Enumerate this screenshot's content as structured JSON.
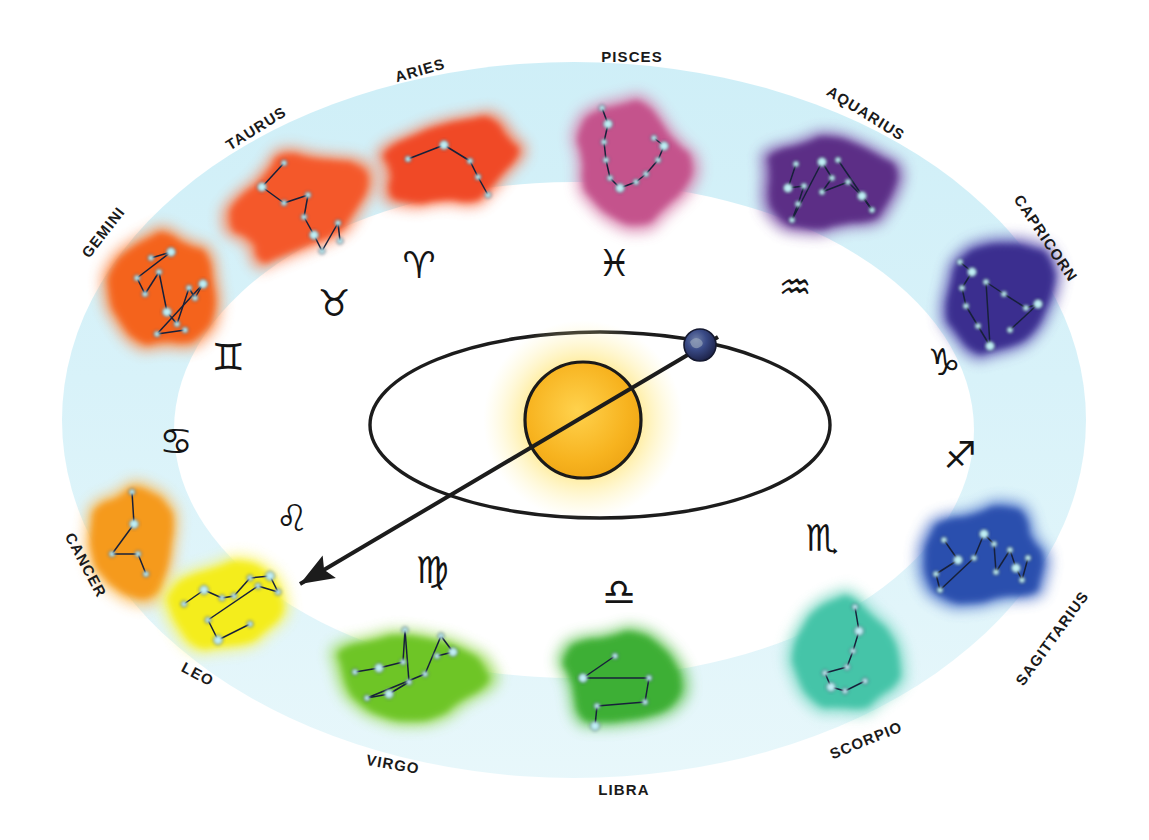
{
  "diagram": {
    "center_objects": {
      "sun": {
        "name": "Sun",
        "color": "#F5B921",
        "glow_color": "#FFE97A",
        "cx": 583,
        "cy": 420,
        "r": 58
      },
      "earth": {
        "name": "Earth",
        "color": "#2A3264",
        "cx": 700,
        "cy": 345,
        "r": 16
      },
      "orbit": {
        "name": "Earth orbit ellipse",
        "cx": 600,
        "cy": 425,
        "rx": 230,
        "ry": 93,
        "stroke": "#1c1c1c"
      },
      "sightline": {
        "name": "Line of sight from Earth through Sun to Leo",
        "x1": 718,
        "y1": 337,
        "x2": 300,
        "y2": 584,
        "stroke": "#1c1c1c"
      }
    },
    "ring": {
      "name": "zodiac band",
      "fill_top": "#CFEFF7",
      "fill_bottom": "#E6F6FA",
      "outer": {
        "cx": 574,
        "cy": 420,
        "rx": 512,
        "ry": 358
      },
      "inner": {
        "cx": 574,
        "cy": 430,
        "rx": 400,
        "ry": 248
      }
    },
    "star_color": "#BFEFF5",
    "signs": [
      {
        "name": "ARIES",
        "symbol": "♈",
        "blob_color": "#F04A26",
        "blob_glow": "#F9714A",
        "label": {
          "x": 420,
          "y": 70,
          "rotate": -16
        },
        "sym": {
          "x": 419,
          "y": 265
        },
        "blob": {
          "cx": 452,
          "cy": 163,
          "rx": 66,
          "ry": 44,
          "rotate": -8
        },
        "stars": [
          [
            -44,
            -4
          ],
          [
            -8,
            -18
          ],
          [
            18,
            -2
          ],
          [
            26,
            14
          ],
          [
            36,
            32
          ]
        ]
      },
      {
        "name": "TAURUS",
        "symbol": "♉",
        "blob_color": "#F4592B",
        "blob_glow": "#FA7C4E",
        "label": {
          "x": 256,
          "y": 128,
          "rotate": -32
        },
        "sym": {
          "x": 334,
          "y": 303
        },
        "blob": {
          "cx": 300,
          "cy": 205,
          "rx": 70,
          "ry": 48,
          "rotate": -36
        },
        "stars": [
          [
            -16,
            -42
          ],
          [
            -38,
            -18
          ],
          [
            -16,
            -2
          ],
          [
            8,
            -10
          ],
          [
            4,
            12
          ],
          [
            14,
            30
          ],
          [
            22,
            46
          ],
          [
            38,
            18
          ],
          [
            40,
            36
          ]
        ]
      },
      {
        "name": "GEMINI",
        "symbol": "♊",
        "blob_color": "#F4641F",
        "blob_glow": "#FA8442",
        "label": {
          "x": 103,
          "y": 232,
          "rotate": -52
        },
        "sym": {
          "x": 228,
          "y": 357
        },
        "blob": {
          "cx": 165,
          "cy": 290,
          "rx": 50,
          "ry": 60,
          "rotate": -10
        },
        "stars": [
          [
            -14,
            -32
          ],
          [
            6,
            -38
          ],
          [
            -28,
            -12
          ],
          [
            -20,
            4
          ],
          [
            -6,
            -18
          ],
          [
            2,
            22
          ],
          [
            12,
            34
          ],
          [
            24,
            -2
          ],
          [
            30,
            8
          ],
          [
            38,
            -6
          ],
          [
            -8,
            44
          ],
          [
            20,
            40
          ]
        ]
      },
      {
        "name": "CANCER",
        "symbol": "♋",
        "blob_color": "#F59A1E",
        "blob_glow": "#FBB44A",
        "label": {
          "x": 86,
          "y": 565,
          "rotate": 62
        },
        "sym": {
          "x": 176,
          "y": 441
        },
        "blob": {
          "cx": 134,
          "cy": 540,
          "rx": 42,
          "ry": 62,
          "rotate": 8
        },
        "stars": [
          [
            -2,
            -48
          ],
          [
            0,
            -16
          ],
          [
            -22,
            14
          ],
          [
            4,
            14
          ],
          [
            12,
            34
          ]
        ]
      },
      {
        "name": "LEO",
        "symbol": "♌",
        "blob_color": "#F4ED1C",
        "blob_glow": "#F8F356",
        "label": {
          "x": 198,
          "y": 674,
          "rotate": 28
        },
        "sym": {
          "x": 292,
          "y": 518
        },
        "blob": {
          "cx": 232,
          "cy": 606,
          "rx": 62,
          "ry": 44,
          "rotate": -8
        },
        "stars": [
          [
            -48,
            -2
          ],
          [
            -28,
            -16
          ],
          [
            -10,
            -8
          ],
          [
            2,
            -10
          ],
          [
            18,
            -28
          ],
          [
            38,
            -30
          ],
          [
            46,
            -14
          ],
          [
            26,
            -20
          ],
          [
            -24,
            14
          ],
          [
            -14,
            34
          ],
          [
            18,
            18
          ]
        ]
      },
      {
        "name": "VIRGO",
        "symbol": "♍",
        "blob_color": "#6EC528",
        "blob_glow": "#93D84E",
        "label": {
          "x": 393,
          "y": 764,
          "rotate": 10
        },
        "sym": {
          "x": 432,
          "y": 570
        },
        "blob": {
          "cx": 407,
          "cy": 678,
          "rx": 72,
          "ry": 48,
          "rotate": 6
        },
        "stars": [
          [
            -52,
            -6
          ],
          [
            -28,
            -10
          ],
          [
            -4,
            -16
          ],
          [
            -2,
            -48
          ],
          [
            2,
            4
          ],
          [
            -18,
            16
          ],
          [
            -40,
            20
          ],
          [
            18,
            -4
          ],
          [
            34,
            -42
          ],
          [
            46,
            -26
          ],
          [
            30,
            -22
          ]
        ]
      },
      {
        "name": "LIBRA",
        "symbol": "♎",
        "blob_color": "#3EAF35",
        "blob_glow": "#63C557",
        "label": {
          "x": 624,
          "y": 789,
          "rotate": 0
        },
        "sym": {
          "x": 619,
          "y": 592
        },
        "blob": {
          "cx": 619,
          "cy": 680,
          "rx": 58,
          "ry": 46,
          "rotate": 0
        },
        "stars": [
          [
            -4,
            -24
          ],
          [
            -36,
            -2
          ],
          [
            30,
            -2
          ],
          [
            26,
            22
          ],
          [
            -22,
            26
          ],
          [
            -24,
            46
          ]
        ]
      },
      {
        "name": "SCORPIO",
        "symbol": "♏",
        "blob_color": "#45C4A8",
        "blob_glow": "#73D6C0",
        "label": {
          "x": 866,
          "y": 740,
          "rotate": -22
        },
        "sym": {
          "x": 822,
          "y": 538
        },
        "blob": {
          "cx": 847,
          "cy": 655,
          "rx": 48,
          "ry": 60,
          "rotate": -28
        },
        "stars": [
          [
            8,
            -48
          ],
          [
            12,
            -24
          ],
          [
            6,
            -4
          ],
          [
            0,
            12
          ],
          [
            -22,
            18
          ],
          [
            -16,
            32
          ],
          [
            -2,
            36
          ],
          [
            18,
            26
          ]
        ]
      },
      {
        "name": "SAGITTARIUS",
        "symbol": "♐",
        "blob_color": "#2B4FAE",
        "blob_glow": "#4C71C9",
        "label": {
          "x": 1052,
          "y": 638,
          "rotate": -54
        },
        "sym": {
          "x": 960,
          "y": 455
        },
        "blob": {
          "cx": 988,
          "cy": 558,
          "rx": 60,
          "ry": 46,
          "rotate": -4
        },
        "stars": [
          [
            -44,
            -18
          ],
          [
            -30,
            2
          ],
          [
            -52,
            16
          ],
          [
            -48,
            32
          ],
          [
            -14,
            0
          ],
          [
            -4,
            -24
          ],
          [
            6,
            -14
          ],
          [
            8,
            14
          ],
          [
            22,
            -8
          ],
          [
            28,
            10
          ],
          [
            34,
            22
          ],
          [
            40,
            0
          ]
        ]
      },
      {
        "name": "CAPRICORN",
        "symbol": "♑",
        "blob_color": "#3A2F8F",
        "blob_glow": "#5A4FB0",
        "label": {
          "x": 1046,
          "y": 238,
          "rotate": 56
        },
        "sym": {
          "x": 944,
          "y": 362
        },
        "blob": {
          "cx": 1000,
          "cy": 300,
          "rx": 52,
          "ry": 60,
          "rotate": 14
        },
        "stars": [
          [
            -40,
            -38
          ],
          [
            -28,
            -28
          ],
          [
            -38,
            -12
          ],
          [
            -34,
            6
          ],
          [
            -22,
            26
          ],
          [
            -10,
            46
          ],
          [
            -14,
            -18
          ],
          [
            4,
            -6
          ],
          [
            26,
            8
          ],
          [
            38,
            4
          ],
          [
            10,
            30
          ]
        ]
      },
      {
        "name": "AQUARIUS",
        "symbol": "♒",
        "blob_color": "#5B2E86",
        "blob_glow": "#7B4FA6",
        "label": {
          "x": 866,
          "y": 113,
          "rotate": 32
        },
        "sym": {
          "x": 795,
          "y": 287
        },
        "blob": {
          "cx": 836,
          "cy": 182,
          "rx": 72,
          "ry": 50,
          "rotate": 6
        },
        "stars": [
          [
            -40,
            -18
          ],
          [
            -48,
            6
          ],
          [
            -32,
            4
          ],
          [
            -38,
            22
          ],
          [
            -44,
            38
          ],
          [
            -14,
            -20
          ],
          [
            -4,
            -4
          ],
          [
            -14,
            10
          ],
          [
            12,
            0
          ],
          [
            26,
            14
          ],
          [
            36,
            28
          ],
          [
            2,
            -22
          ]
        ]
      },
      {
        "name": "PISCES",
        "symbol": "♓",
        "blob_color": "#C4528C",
        "blob_glow": "#D67AA8",
        "label": {
          "x": 632,
          "y": 56,
          "rotate": 0
        },
        "sym": {
          "x": 614,
          "y": 263
        },
        "blob": {
          "cx": 630,
          "cy": 160,
          "rx": 56,
          "ry": 58,
          "rotate": 0
        },
        "stars": [
          [
            -28,
            -52
          ],
          [
            -22,
            -36
          ],
          [
            -26,
            -18
          ],
          [
            -24,
            0
          ],
          [
            -20,
            18
          ],
          [
            -10,
            28
          ],
          [
            6,
            22
          ],
          [
            16,
            14
          ],
          [
            28,
            0
          ],
          [
            34,
            -14
          ],
          [
            24,
            -22
          ]
        ]
      }
    ]
  }
}
